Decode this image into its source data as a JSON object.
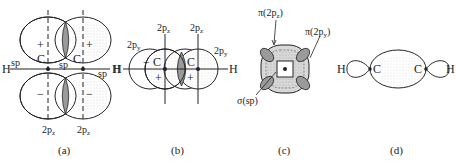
{
  "figure": {
    "panels": [
      {
        "id": "a",
        "caption": "(a)",
        "atoms": [
          "H",
          "C",
          "C",
          "H"
        ],
        "labels": {
          "sp_left": "sp",
          "sp_center": "sp",
          "sp_right": "sp",
          "pz_left": "2p",
          "pz_right": "2p",
          "sub": "z",
          "plus": "+",
          "minus": "−"
        }
      },
      {
        "id": "b",
        "caption": "(b)",
        "atoms": [
          "H",
          "C",
          "C",
          "H"
        ],
        "labels": {
          "pz_left": "2p",
          "pz_right": "2p",
          "pz_sub": "z",
          "py_left": "2p",
          "py_right": "2p",
          "py_sub": "y",
          "plus": "+",
          "minus": "−"
        }
      },
      {
        "id": "c",
        "caption": "(c)",
        "labels": {
          "pi_z": "π(2p",
          "pi_z_sub": "z",
          "pi_y": "π(2p",
          "pi_y_sub": "y",
          "close": ")",
          "sigma": "σ(sp)"
        }
      },
      {
        "id": "d",
        "caption": "(d)",
        "atoms": [
          "H",
          "C",
          "C",
          "H"
        ]
      }
    ],
    "colors": {
      "line": "#222222",
      "shade": "#9a9a9a",
      "light_shade": "#d8d8d8"
    }
  }
}
